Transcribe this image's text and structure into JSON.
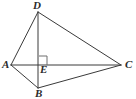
{
  "figure": {
    "background_color": "#ffffff",
    "line_color": "#3a3a3a",
    "label_color": "#2b2b2b",
    "width": 136,
    "height": 99
  },
  "points": {
    "D": {
      "label": "D",
      "x": 38,
      "y": 12,
      "label_x": 33,
      "label_y": 0
    },
    "A": {
      "label": "A",
      "x": 11,
      "y": 65,
      "label_x": 2,
      "label_y": 59
    },
    "C": {
      "label": "C",
      "x": 121,
      "y": 65,
      "label_x": 125,
      "label_y": 59
    },
    "B": {
      "label": "B",
      "x": 38,
      "y": 88,
      "label_x": 35,
      "label_y": 88
    },
    "E": {
      "label": "E",
      "x": 39,
      "y": 65,
      "label_x": 40,
      "label_y": 64
    }
  },
  "segments": [
    {
      "name": "segment-DA",
      "from": "D",
      "to": "A",
      "x1": 38,
      "y1": 12,
      "x2": 11,
      "y2": 65
    },
    {
      "name": "segment-DC",
      "from": "D",
      "to": "C",
      "x1": 38,
      "y1": 12,
      "x2": 121,
      "y2": 65
    },
    {
      "name": "segment-DB",
      "from": "D",
      "to": "B",
      "x1": 38,
      "y1": 12,
      "x2": 38,
      "y2": 88
    },
    {
      "name": "segment-AC",
      "from": "A",
      "to": "C",
      "x1": 11,
      "y1": 65,
      "x2": 121,
      "y2": 65
    },
    {
      "name": "segment-AB",
      "from": "A",
      "to": "B",
      "x1": 11,
      "y1": 65,
      "x2": 38,
      "y2": 88
    },
    {
      "name": "segment-BC",
      "from": "B",
      "to": "C",
      "x1": 38,
      "y1": 88,
      "x2": 121,
      "y2": 65
    }
  ],
  "right_angle_marker": {
    "name": "right-angle-mark-at-E",
    "vertex": "E",
    "path": "M 39 56 L 47 56 L 47 65",
    "size": 9
  }
}
